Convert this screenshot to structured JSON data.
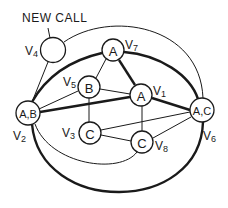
{
  "annotation": {
    "label": "NEW CALL",
    "points_to": "V4"
  },
  "nodes": [
    {
      "id": "V1",
      "label": "A",
      "name": "V",
      "sub": "1"
    },
    {
      "id": "V2",
      "label": "A,B",
      "name": "V",
      "sub": "2"
    },
    {
      "id": "V3",
      "label": "C",
      "name": "V",
      "sub": "3"
    },
    {
      "id": "V4",
      "label": "",
      "name": "V",
      "sub": "4"
    },
    {
      "id": "V5",
      "label": "B",
      "name": "V",
      "sub": "5"
    },
    {
      "id": "V6",
      "label": "A,C",
      "name": "V",
      "sub": "6"
    },
    {
      "id": "V7",
      "label": "A",
      "name": "V",
      "sub": "7"
    },
    {
      "id": "V8",
      "label": "C",
      "name": "V",
      "sub": "8"
    }
  ],
  "edges": [
    {
      "from": "V4",
      "to": "V2",
      "style": "thin"
    },
    {
      "from": "V4",
      "to": "V6",
      "style": "thin",
      "shape": "arc"
    },
    {
      "from": "V2",
      "to": "V7",
      "style": "thick",
      "shape": "arc"
    },
    {
      "from": "V7",
      "to": "V6",
      "style": "thick",
      "shape": "arc"
    },
    {
      "from": "V7",
      "to": "V5",
      "style": "thin"
    },
    {
      "from": "V7",
      "to": "V1",
      "style": "thick"
    },
    {
      "from": "V2",
      "to": "V5",
      "style": "thin"
    },
    {
      "from": "V2",
      "to": "V1",
      "style": "thick"
    },
    {
      "from": "V5",
      "to": "V1",
      "style": "thin"
    },
    {
      "from": "V5",
      "to": "V3",
      "style": "thin"
    },
    {
      "from": "V1",
      "to": "V6",
      "style": "thick"
    },
    {
      "from": "V1",
      "to": "V8",
      "style": "thin"
    },
    {
      "from": "V3",
      "to": "V6",
      "style": "thin"
    },
    {
      "from": "V3",
      "to": "V8",
      "style": "thin"
    },
    {
      "from": "V8",
      "to": "V6",
      "style": "thin"
    },
    {
      "from": "V2",
      "to": "V8",
      "style": "thin",
      "shape": "arc"
    },
    {
      "from": "V2",
      "to": "V6",
      "style": "thick",
      "shape": "arc"
    }
  ]
}
